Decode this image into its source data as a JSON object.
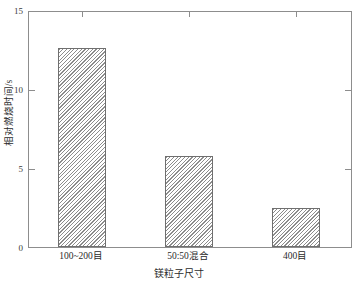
{
  "chart_data": {
    "type": "bar",
    "title": "",
    "subtitle": "",
    "xlabel": "镁粒子尺寸",
    "ylabel": "相对燃烧时间/s",
    "categories": [
      "100~200目",
      "50:50混合",
      "400目"
    ],
    "values": [
      12.7,
      5.8,
      2.5
    ],
    "series": [
      {
        "name": "相对燃烧时间",
        "values": [
          12.7,
          5.8,
          2.5
        ]
      }
    ],
    "ylim": [
      0,
      15
    ],
    "yticks": [
      0,
      5,
      10,
      15
    ],
    "ytick_labels": [
      "0",
      "5",
      "10",
      "15"
    ],
    "grid": false,
    "legend": false,
    "legend_position": "none",
    "bar_fill": "hatched-diagonal",
    "bar_edge_color": "#6f6f6f",
    "frame_color": "#8d8d8d",
    "background": "#ffffff"
  },
  "axes": {
    "y": {
      "title": "相对燃烧时间/s",
      "ticks": [
        {
          "label": "15",
          "value": 15
        },
        {
          "label": "10",
          "value": 10
        },
        {
          "label": "5",
          "value": 5
        },
        {
          "label": "0",
          "value": 0
        }
      ]
    },
    "x": {
      "title": "镁粒子尺寸",
      "ticks": [
        {
          "label": "100~200目"
        },
        {
          "label": "50:50混合"
        },
        {
          "label": "400目"
        }
      ]
    }
  }
}
